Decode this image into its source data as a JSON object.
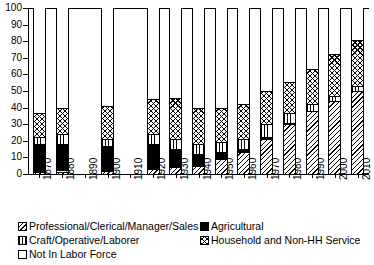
{
  "chart_data": {
    "type": "bar",
    "subtype": "stacked-bar-100-percent",
    "title": "",
    "xlabel": "",
    "ylabel": "",
    "ylim": [
      0,
      100
    ],
    "yticks": [
      0,
      10,
      20,
      30,
      40,
      50,
      60,
      70,
      80,
      90,
      100
    ],
    "ytick_labels": [
      "0",
      "10",
      "20",
      "30",
      "40",
      "50",
      "60",
      "70",
      "80",
      "90",
      "100"
    ],
    "grid": false,
    "legend_position": "below",
    "categories": [
      "1870",
      "1880",
      "1890",
      "1900",
      "1910",
      "1920",
      "1930",
      "1940",
      "1950",
      "1960",
      "1970",
      "1980",
      "1990",
      "2000",
      "2010"
    ],
    "series": [
      {
        "name": "Professional/Clerical/Manager/Sales",
        "pattern": "backslash-hatch",
        "values": [
          1,
          1.5,
          null,
          2,
          null,
          3,
          4,
          5,
          9,
          13,
          21,
          30,
          38,
          44,
          50
        ]
      },
      {
        "name": "Agricultural",
        "pattern": "solid-black",
        "values": [
          17,
          16.5,
          null,
          15,
          null,
          15,
          11,
          7,
          4,
          2,
          1,
          0.5,
          0,
          0,
          0
        ]
      },
      {
        "name": "Craft/Operative/Laborer",
        "pattern": "vertical-lines",
        "values": [
          4,
          6,
          null,
          4,
          null,
          6,
          6,
          6,
          6,
          6,
          8,
          6,
          4,
          3,
          3
        ]
      },
      {
        "name": "Household and Non-HH Service",
        "pattern": "cross-hatch",
        "values": [
          15,
          15.5,
          null,
          20,
          null,
          21,
          25,
          22,
          21,
          21,
          20,
          19,
          21,
          25,
          28
        ]
      },
      {
        "name": "Not In Labor Force",
        "pattern": "empty-white",
        "values": [
          63,
          60.5,
          null,
          59,
          null,
          55,
          54,
          60,
          60,
          58,
          50,
          44.5,
          37,
          28,
          19
        ]
      }
    ],
    "cumulative_tops": {
      "1870": [
        1,
        18,
        22,
        37,
        100
      ],
      "1880": [
        1.5,
        18,
        24,
        39.5,
        100
      ],
      "1900": [
        2,
        17,
        21,
        41,
        100
      ],
      "1920": [
        3,
        18,
        24,
        45,
        100
      ],
      "1930": [
        4,
        15,
        21,
        46,
        100
      ],
      "1940": [
        5,
        12,
        18,
        40,
        100
      ],
      "1950": [
        9,
        13,
        19,
        40,
        100
      ],
      "1960": [
        13,
        15,
        21,
        42,
        100
      ],
      "1970": [
        21,
        22,
        30,
        50,
        100
      ],
      "1980": [
        30,
        30.5,
        36.5,
        55.5,
        100
      ],
      "1990": [
        38,
        38,
        42,
        63,
        100
      ],
      "2000": [
        44,
        44,
        47,
        72,
        100
      ],
      "2010": [
        50,
        50,
        53,
        81,
        100
      ]
    },
    "missing_categories": [
      "1890",
      "1910"
    ]
  },
  "legend": {
    "entries": [
      {
        "label": "Professional/Clerical/Manager/Sales",
        "pattern": "backslash-hatch",
        "column": 1,
        "row": 1
      },
      {
        "label": "Agricultural",
        "pattern": "solid-black",
        "column": 2,
        "row": 1
      },
      {
        "label": "Craft/Operative/Laborer",
        "pattern": "vertical-lines",
        "column": 1,
        "row": 2
      },
      {
        "label": "Household and Non-HH Service",
        "pattern": "cross-hatch",
        "column": 2,
        "row": 2
      },
      {
        "label": "Not In Labor Force",
        "pattern": "empty-white",
        "column": 1,
        "row": 3
      }
    ]
  }
}
